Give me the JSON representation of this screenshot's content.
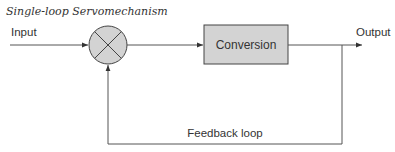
{
  "title": "Single-loop Servomechanism",
  "labels": {
    "input": "Input",
    "output": "Output",
    "block": "Conversion",
    "feedback": "Feedback loop"
  },
  "colors": {
    "stroke": "#555555",
    "fill": "#d3d3d3",
    "text": "#333333"
  }
}
